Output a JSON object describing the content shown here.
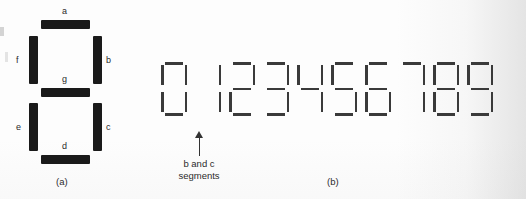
{
  "figure": {
    "background_color": "#fdfdfd",
    "segment_color_thick": "#1a1a1a",
    "segment_color_thin": "#3a3a3a",
    "text_color": "#2b2b2b"
  },
  "panel_a": {
    "caption": "(a)",
    "description": "seven-segment display with labelled segments",
    "segment_labels": {
      "a": "a",
      "b": "b",
      "c": "c",
      "d": "d",
      "e": "e",
      "f": "f",
      "g": "g"
    },
    "segments": [
      {
        "id": "a",
        "orientation": "horizontal",
        "label": "a"
      },
      {
        "id": "b",
        "orientation": "vertical",
        "label": "b"
      },
      {
        "id": "c",
        "orientation": "vertical",
        "label": "c"
      },
      {
        "id": "d",
        "orientation": "horizontal",
        "label": "d"
      },
      {
        "id": "e",
        "orientation": "vertical",
        "label": "e"
      },
      {
        "id": "f",
        "orientation": "vertical",
        "label": "f"
      },
      {
        "id": "g",
        "orientation": "horizontal",
        "label": "g"
      }
    ]
  },
  "panel_b": {
    "caption": "(b)",
    "description": "digits zero through nine rendered on seven-segment displays",
    "digits": [
      {
        "value": "0",
        "lit_segments": [
          "a",
          "b",
          "c",
          "d",
          "e",
          "f"
        ]
      },
      {
        "value": "1",
        "lit_segments": [
          "b",
          "c"
        ]
      },
      {
        "value": "2",
        "lit_segments": [
          "a",
          "b",
          "g",
          "e",
          "d"
        ]
      },
      {
        "value": "3",
        "lit_segments": [
          "a",
          "b",
          "g",
          "c",
          "d"
        ]
      },
      {
        "value": "4",
        "lit_segments": [
          "f",
          "g",
          "b",
          "c"
        ]
      },
      {
        "value": "5",
        "lit_segments": [
          "a",
          "f",
          "g",
          "c",
          "d"
        ]
      },
      {
        "value": "6",
        "lit_segments": [
          "a",
          "f",
          "g",
          "e",
          "c",
          "d"
        ]
      },
      {
        "value": "7",
        "lit_segments": [
          "a",
          "b",
          "c"
        ]
      },
      {
        "value": "8",
        "lit_segments": [
          "a",
          "b",
          "c",
          "d",
          "e",
          "f",
          "g"
        ]
      },
      {
        "value": "9",
        "lit_segments": [
          "a",
          "b",
          "c",
          "d",
          "f",
          "g"
        ]
      }
    ],
    "annotation": {
      "line1": "b and c",
      "line2": "segments",
      "points_to": "1"
    }
  }
}
